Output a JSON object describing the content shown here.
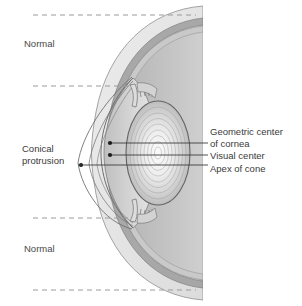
{
  "figure": {
    "type": "anatomical-cross-section",
    "orientation": "anterior-left",
    "background_color": "#ffffff"
  },
  "labels": {
    "normal_top": "Normal",
    "normal_bottom": "Normal",
    "conical_protrusion": "Conical\nprotrusion",
    "geometric_center_of_cornea": "Geometric center\nof cornea",
    "visual_center": "Visual center",
    "apex_of_cone": "Apex of cone"
  },
  "markers": [
    {
      "name": "geometric-center-of-cornea",
      "x": 110,
      "y": 143
    },
    {
      "name": "visual-center",
      "x": 110,
      "y": 155
    },
    {
      "name": "apex-of-cone",
      "x": 81,
      "y": 165
    }
  ],
  "leader_lines": [
    {
      "name": "leader-geometric-center",
      "x1": 110,
      "y1": 143,
      "x2": 208,
      "y2": 143
    },
    {
      "name": "leader-visual-center",
      "x1": 110,
      "y1": 155,
      "x2": 208,
      "y2": 155
    },
    {
      "name": "leader-apex-of-cone",
      "x1": 81,
      "y1": 165,
      "x2": 208,
      "y2": 165
    }
  ],
  "dashed_reference_lines": [
    {
      "name": "dashed-line-top",
      "y": 15,
      "x1": 33,
      "x2": 196
    },
    {
      "name": "dashed-line-upper-mid",
      "y": 86,
      "x1": 33,
      "x2": 130
    },
    {
      "name": "dashed-line-lower-mid",
      "y": 218,
      "x1": 33,
      "x2": 130
    },
    {
      "name": "dashed-line-bottom",
      "y": 290,
      "x1": 33,
      "x2": 196
    }
  ],
  "colors": {
    "sclera_outer": "#e3e3e3",
    "sclera_band": "#a8a8a8",
    "choroid": "#c9c9c9",
    "vitreous": "#bdbdbd",
    "anterior_chamber": "#d2d2d2",
    "lens_outer": "#c4c4c4",
    "lens_core": "#f2f2f2",
    "outline": "#6e6e6e",
    "cone_outline": "#707070",
    "dashed": "#9a9a9a",
    "leader": "#3c3c3c",
    "marker": "#1c1c1c",
    "text": "#3a3a3a"
  }
}
